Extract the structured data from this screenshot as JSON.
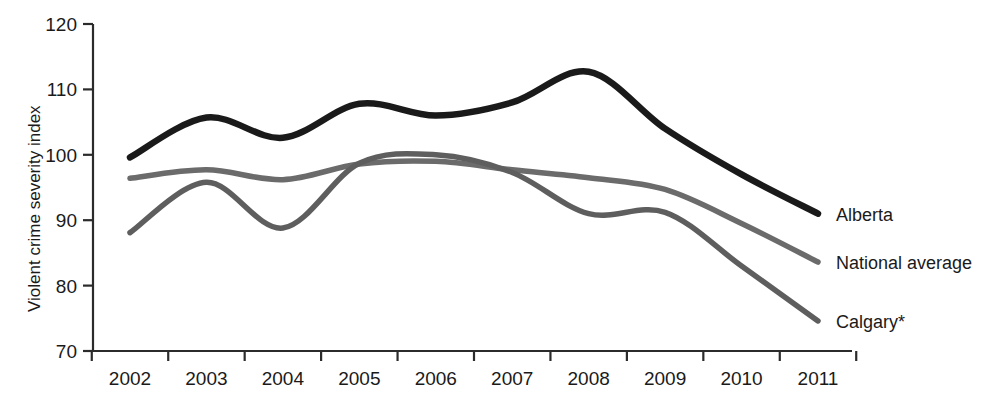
{
  "chart_data": {
    "type": "line",
    "title": "",
    "subtitle": "",
    "xlabel": "",
    "ylabel": "Violent crime severity index",
    "categories": [
      "2002",
      "2003",
      "2004",
      "2005",
      "2006",
      "2007",
      "2008",
      "2009",
      "2010",
      "2011"
    ],
    "x": [
      2002,
      2003,
      2004,
      2005,
      2006,
      2007,
      2008,
      2009,
      2010,
      2011
    ],
    "xlim": [
      2002,
      2011
    ],
    "ylim": [
      70,
      120
    ],
    "yticks": [
      70,
      80,
      90,
      100,
      110,
      120
    ],
    "xticks": [
      "2002",
      "2003",
      "2004",
      "2005",
      "2006",
      "2007",
      "2008",
      "2009",
      "2010",
      "2011"
    ],
    "grid": false,
    "legend_position": "right-inline-end-of-line",
    "series": [
      {
        "name": "Alberta",
        "color": "#1a1a1a",
        "values": [
          99.6,
          105.7,
          102.6,
          107.8,
          106.0,
          108.0,
          112.7,
          104.0,
          97.0,
          91.0
        ]
      },
      {
        "name": "National average",
        "color": "#6b6b6b",
        "values": [
          96.4,
          97.7,
          96.2,
          98.6,
          99.0,
          97.7,
          96.5,
          94.7,
          89.5,
          83.6
        ]
      },
      {
        "name": "Calgary*",
        "color": "#5e5e5e",
        "values": [
          88.1,
          95.8,
          88.8,
          98.7,
          100.0,
          97.3,
          91.0,
          91.2,
          83.0,
          74.6
        ]
      }
    ],
    "annotations": []
  },
  "axis": {
    "y_title": "Violent crime severity index",
    "y_tick_labels": [
      "120",
      "110",
      "100",
      "90",
      "80",
      "70"
    ],
    "x_tick_labels": [
      "2002",
      "2003",
      "2004",
      "2005",
      "2006",
      "2007",
      "2008",
      "2009",
      "2010",
      "2011"
    ]
  },
  "legend": {
    "items": [
      {
        "label": "Alberta"
      },
      {
        "label": "National average"
      },
      {
        "label": "Calgary*"
      }
    ]
  },
  "colors": {
    "alberta": "#1a1a1a",
    "national_average": "#6b6b6b",
    "calgary": "#5e5e5e",
    "axis": "#2b2b2b",
    "background": "#ffffff"
  }
}
